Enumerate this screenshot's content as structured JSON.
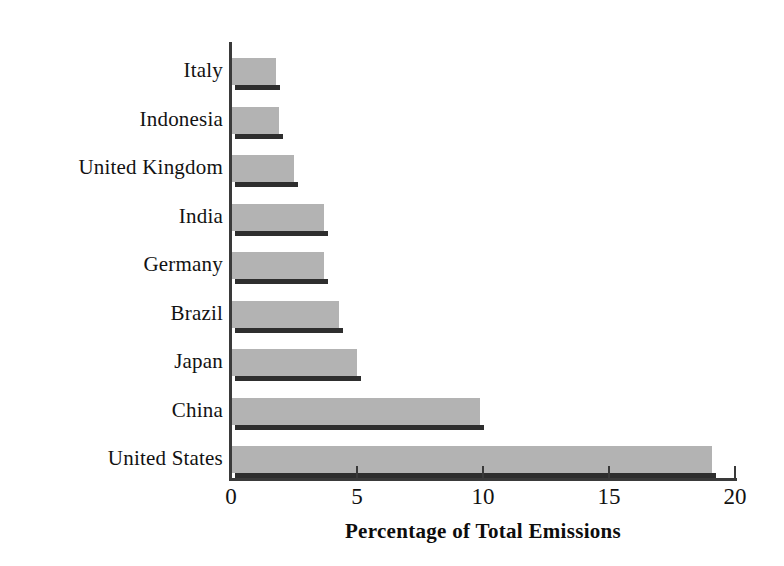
{
  "chart_data": {
    "type": "bar",
    "orientation": "horizontal",
    "title": "",
    "xlabel": "Percentage of Total Emissions",
    "ylabel": "",
    "xlim": [
      0,
      20
    ],
    "xticks": [
      0,
      5,
      10,
      15,
      20
    ],
    "xtick_labels": [
      "0",
      "5",
      "10",
      "15",
      "20"
    ],
    "grid": false,
    "legend": false,
    "categories": [
      "Italy",
      "Indonesia",
      "United Kingdom",
      "India",
      "Germany",
      "Brazil",
      "Japan",
      "China",
      "United States"
    ],
    "values": [
      1.8,
      1.9,
      2.5,
      3.7,
      3.7,
      4.3,
      5.0,
      9.9,
      19.1
    ],
    "series": [
      {
        "name": "Percentage of Total Emissions",
        "values": [
          1.8,
          1.9,
          2.5,
          3.7,
          3.7,
          4.3,
          5.0,
          9.9,
          19.1
        ]
      }
    ],
    "bar_color": "#b3b3b3",
    "bar_shadow_color": "#2e2e2e",
    "axis_color": "#3a3a3a",
    "background_color": "#ffffff"
  },
  "axis": {
    "x_title": "Percentage of Total Emissions",
    "ticks": [
      {
        "label": "0",
        "value": 0
      },
      {
        "label": "5",
        "value": 5
      },
      {
        "label": "10",
        "value": 10
      },
      {
        "label": "15",
        "value": 15
      },
      {
        "label": "20",
        "value": 20
      }
    ]
  },
  "bars": [
    {
      "label": "Italy",
      "value": 1.8
    },
    {
      "label": "Indonesia",
      "value": 1.9
    },
    {
      "label": "United Kingdom",
      "value": 2.5
    },
    {
      "label": "India",
      "value": 3.7
    },
    {
      "label": "Germany",
      "value": 3.7
    },
    {
      "label": "Brazil",
      "value": 4.3
    },
    {
      "label": "Japan",
      "value": 5.0
    },
    {
      "label": "China",
      "value": 9.9
    },
    {
      "label": "United States",
      "value": 19.1
    }
  ]
}
